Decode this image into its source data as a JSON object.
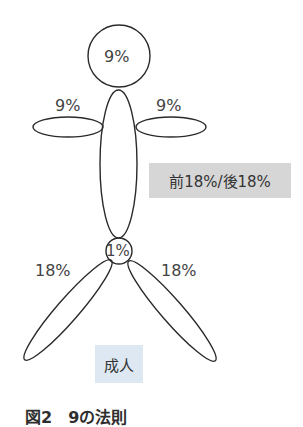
{
  "figure": {
    "head_label": "9%",
    "left_arm_label": "9%",
    "right_arm_label": "9%",
    "trunk_label": "前18%/後18%",
    "genital_label": "1%",
    "left_leg_label": "18%",
    "right_leg_label": "18%",
    "subject_label": "成人"
  },
  "caption": "図2　9の法則",
  "colors": {
    "outline": "#2a2a2a",
    "trunk_label_bg": "#d6d6d6",
    "subject_label_bg": "#dde8f3"
  }
}
